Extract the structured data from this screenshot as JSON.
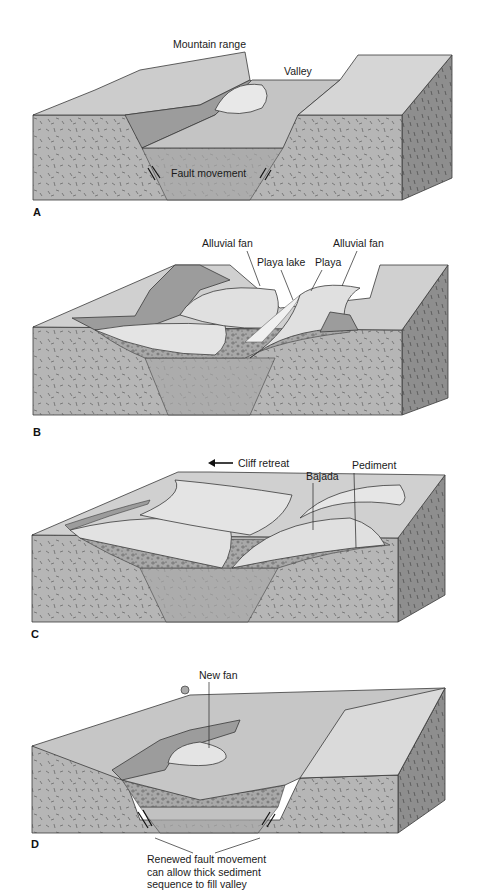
{
  "figure": {
    "panels": [
      {
        "id": "A",
        "letter": "A",
        "labels": {
          "mountain_range": "Mountain range",
          "valley": "Valley",
          "fault_movement": "Fault movement"
        }
      },
      {
        "id": "B",
        "letter": "B",
        "labels": {
          "alluvial_fan_left": "Alluvial fan",
          "playa_lake": "Playa lake",
          "playa": "Playa",
          "alluvial_fan_right": "Alluvial fan"
        }
      },
      {
        "id": "C",
        "letter": "C",
        "labels": {
          "cliff_retreat": "Cliff retreat",
          "bajada": "Bajada",
          "pediment": "Pediment"
        }
      },
      {
        "id": "D",
        "letter": "D",
        "labels": {
          "new_fan": "New fan",
          "renewed_fault_line1": "Renewed fault movement",
          "renewed_fault_line2": "can allow thick sediment",
          "renewed_fault_line3": "sequence to fill valley"
        }
      }
    ],
    "colors": {
      "top_surface": "#c8c8c8",
      "top_light": "#dcdcdc",
      "front_face": "#b4b4b4",
      "side_face": "#8e8e8e",
      "scarp": "#9c9c9c",
      "fan": "#e6e6e6",
      "sediment": "#a8a8a8",
      "outline": "#3a3a3a"
    }
  }
}
